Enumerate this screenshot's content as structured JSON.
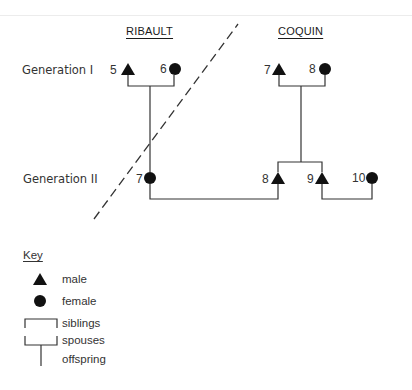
{
  "families": {
    "left": "RIBAULT",
    "right": "COQUIN"
  },
  "generations": {
    "gen1": "Generation I",
    "gen2": "Generation II"
  },
  "individuals": {
    "ribault_5": {
      "number": "5",
      "sex": "male"
    },
    "ribault_6": {
      "number": "6",
      "sex": "female"
    },
    "ribault_7": {
      "number": "7",
      "sex": "female"
    },
    "coquin_7": {
      "number": "7",
      "sex": "male"
    },
    "coquin_8": {
      "number": "8",
      "sex": "female"
    },
    "coquin_gen2_8": {
      "number": "8",
      "sex": "male"
    },
    "coquin_gen2_9": {
      "number": "9",
      "sex": "male"
    },
    "coquin_gen2_10": {
      "number": "10",
      "sex": "female"
    }
  },
  "key": {
    "title": "Key",
    "items": [
      {
        "symbol": "triangle-icon",
        "label": "male"
      },
      {
        "symbol": "circle-icon",
        "label": "female"
      },
      {
        "symbol": "sibling-bracket-icon",
        "label": "siblings"
      },
      {
        "symbol": "spouse-bracket-icon",
        "label": "spouses"
      },
      {
        "symbol": "offspring-line-icon",
        "label": "offspring"
      }
    ]
  },
  "colors": {
    "ink": "#1a1a1a",
    "line": "#333333"
  }
}
